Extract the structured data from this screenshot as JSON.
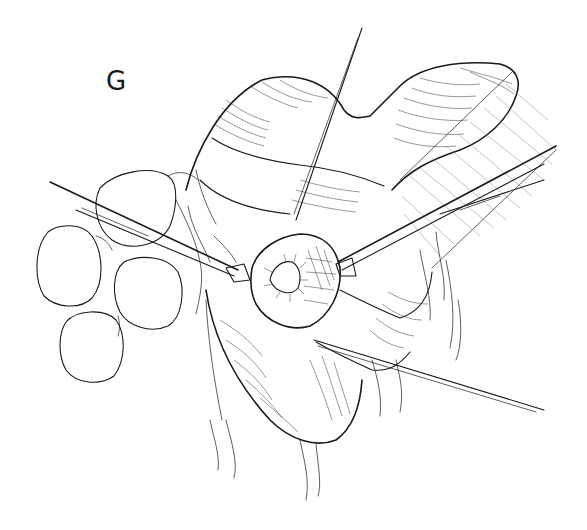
{
  "figure": {
    "panel_label": "G",
    "style": "black-ink-line-drawing",
    "colors": {
      "ink": "#1a1a1a",
      "background": "#ffffff",
      "hatch_light": "#8a8a8a"
    },
    "elements": [
      "bowel-loops",
      "fat-lobules",
      "retractor-left",
      "retractor-right-upper",
      "retractor-right-lower",
      "suture-upper",
      "suture-lower-right",
      "opened-lumen-with-mucosa",
      "mesenteric-tissue-strands",
      "striated-wall-right"
    ]
  }
}
